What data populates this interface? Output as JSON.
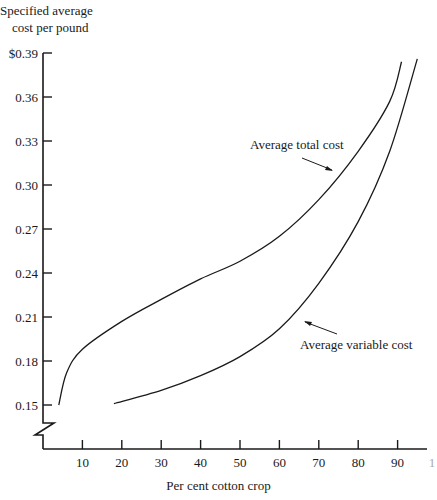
{
  "chart_data": {
    "type": "line",
    "title": "",
    "ylabel": "Specified average cost per pound",
    "ylabel_lines": [
      "Specified average",
      "cost per pound"
    ],
    "xlabel": "Per cent cotton crop",
    "x_ticks": [
      10,
      20,
      30,
      40,
      50,
      60,
      70,
      80,
      90,
      100
    ],
    "x_tick_labels": [
      "10",
      "20",
      "30",
      "40",
      "50",
      "60",
      "70",
      "80",
      "90",
      "1"
    ],
    "y_ticks": [
      0.15,
      0.18,
      0.21,
      0.24,
      0.27,
      0.3,
      0.33,
      0.36,
      0.39
    ],
    "y_tick_labels": [
      "0.15",
      "0.18",
      "0.21",
      "0.24",
      "0.27",
      "0.30",
      "0.33",
      "0.36",
      "$0.39"
    ],
    "xlim": [
      0,
      100
    ],
    "ylim": [
      0.15,
      0.39
    ],
    "y_axis_break": true,
    "grid": false,
    "legend": "none (inline annotations with arrows)",
    "series": [
      {
        "name": "Average total cost",
        "x": [
          4,
          6,
          10,
          20,
          30,
          40,
          50,
          60,
          70,
          80,
          88,
          91
        ],
        "y": [
          0.15,
          0.172,
          0.188,
          0.207,
          0.222,
          0.236,
          0.248,
          0.265,
          0.29,
          0.323,
          0.357,
          0.384
        ]
      },
      {
        "name": "Average variable cost",
        "x": [
          18,
          30,
          40,
          50,
          60,
          70,
          80,
          88,
          95
        ],
        "y": [
          0.151,
          0.16,
          0.17,
          0.183,
          0.202,
          0.233,
          0.275,
          0.323,
          0.386
        ]
      }
    ],
    "annotations": [
      {
        "text": "Average total cost",
        "points_to_series": "Average total cost"
      },
      {
        "text": "Average variable cost",
        "points_to_series": "Average variable cost"
      }
    ]
  },
  "colors": {
    "ink": "#1a1a1a",
    "background": "#ffffff"
  }
}
